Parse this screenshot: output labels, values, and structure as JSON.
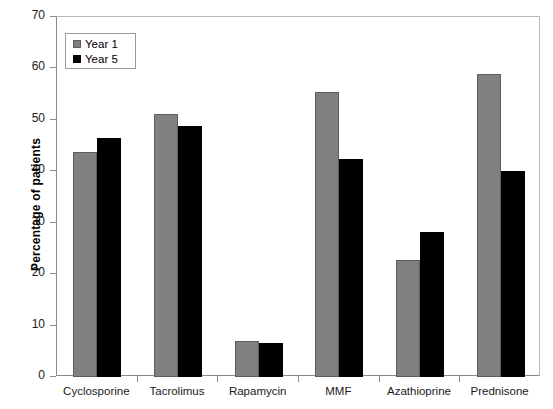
{
  "chart_data": {
    "type": "bar",
    "title": "",
    "xlabel": "",
    "ylabel": "Percentage of patients",
    "categories": [
      "Cyclosporine",
      "Tacrolimus",
      "Rapamycin",
      "MMF",
      "Azathioprine",
      "Prednisone"
    ],
    "series": [
      {
        "name": "Year 1",
        "color": "#808080",
        "values": [
          43.8,
          51.1,
          7.0,
          55.4,
          22.8,
          59.0
        ]
      },
      {
        "name": "Year 5",
        "color": "#000000",
        "values": [
          46.5,
          48.8,
          6.6,
          42.4,
          28.2,
          40.0
        ]
      }
    ],
    "ylim": [
      0,
      70
    ],
    "yticks": [
      0,
      10,
      20,
      30,
      40,
      50,
      60,
      70
    ],
    "ytick_labels": [
      "0",
      "10",
      "20",
      "30",
      "40",
      "50",
      "60",
      "70"
    ],
    "grid": false,
    "legend_position": "upper left"
  },
  "legend": {
    "items": [
      {
        "label": "Year 1"
      },
      {
        "label": "Year 5"
      }
    ]
  }
}
